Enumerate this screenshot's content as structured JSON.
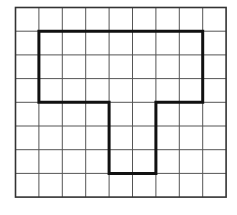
{
  "diagram": {
    "type": "grid-figure",
    "grid": {
      "columns": 9,
      "rows": 8,
      "origin_px": [
        15.5,
        7.5
      ],
      "cell_w_px": 23.4,
      "cell_h_px": 23.7,
      "line_color": "#555555",
      "border_color": "#333333"
    },
    "shape": {
      "name": "T-shaped polygon",
      "stroke_color": "#111111",
      "vertices_cells": [
        [
          1,
          1
        ],
        [
          8,
          1
        ],
        [
          8,
          4
        ],
        [
          6,
          4
        ],
        [
          6,
          7
        ],
        [
          4,
          7
        ],
        [
          4,
          4
        ],
        [
          1,
          4
        ]
      ]
    }
  }
}
